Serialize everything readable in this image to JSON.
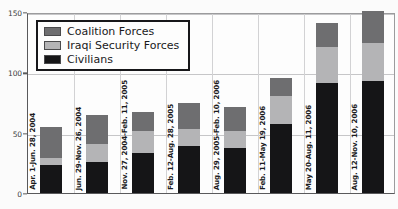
{
  "chart_data": {
    "type": "bar",
    "title": "",
    "subtitle": "",
    "xlabel": "",
    "ylabel": "",
    "ylim": [
      0,
      150
    ],
    "yticks": [
      0,
      50,
      100,
      150
    ],
    "ytick_labels": [
      "0",
      "50",
      "100",
      "150"
    ],
    "grid": true,
    "stacked": true,
    "legend_position": "top-left",
    "categories": [
      "Apr. 1-Jun. 28, 2004",
      "Jun. 29-Nov. 26, 2004",
      "Nov. 27, 2004-Feb. 11, 2005",
      "Feb. 12-Aug. 28, 2005",
      "Aug. 29, 2005-Feb. 10, 2006",
      "Feb. 11-May 19, 2006",
      "May 20-Aug. 11, 2006",
      "Aug. 12-Nov. 10, 2006"
    ],
    "series": [
      {
        "name": "Civilians",
        "color": "#151517",
        "values": [
          23,
          26,
          33,
          39,
          37,
          57,
          91,
          93
        ]
      },
      {
        "name": "Iraqi Security Forces",
        "color": "#b4b4b6",
        "values": [
          6,
          15,
          18,
          14,
          14,
          23,
          30,
          31
        ]
      },
      {
        "name": "Coalition Forces",
        "color": "#6e6e70",
        "values": [
          26,
          24,
          16,
          22,
          20,
          15,
          20,
          27
        ]
      }
    ],
    "totals": [
      55,
      65,
      67,
      75,
      71,
      95,
      141,
      151
    ]
  },
  "legend": {
    "items": [
      {
        "label": "Coalition Forces",
        "color": "#6e6e70"
      },
      {
        "label": "Iraqi Security Forces",
        "color": "#b4b4b6"
      },
      {
        "label": "Civilians",
        "color": "#151517"
      }
    ]
  }
}
